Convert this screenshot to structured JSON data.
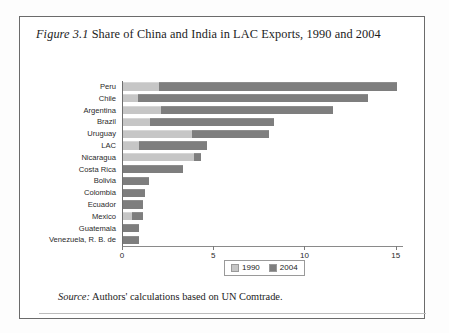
{
  "figure": {
    "number_label": "Figure 3.1",
    "title_text": " Share of China and India in LAC Exports, 1990 and 2004",
    "source_label": "Source:",
    "source_text": " Authors' calculations based on UN Comtrade."
  },
  "colors": {
    "series_1990": "#c6c6c6",
    "series_2004": "#7e7e7e",
    "frame": "#6b6b6b",
    "axis": "#7a7a7a"
  },
  "chart_data": {
    "type": "bar",
    "orientation": "horizontal",
    "stacked": true,
    "title": "Figure 3.1 Share of China and India in LAC Exports, 1990 and 2004",
    "xlabel": "percent",
    "ylabel": "",
    "xlim": [
      0,
      15.4
    ],
    "xticks": [
      0,
      5,
      10,
      15
    ],
    "xtick_labels": [
      "0",
      "5",
      "10",
      "15"
    ],
    "grid": false,
    "legend_position": "bottom-center",
    "categories": [
      "Peru",
      "Chile",
      "Argentina",
      "Brazil",
      "Uruguay",
      "LAC",
      "Nicaragua",
      "Costa Rica",
      "Bolivia",
      "Colombia",
      "Ecuador",
      "Mexico",
      "Guatemala",
      "Venezuela, R. B. de"
    ],
    "series": [
      {
        "name": "1990",
        "color": "#c6c6c6",
        "values": [
          2.0,
          0.8,
          2.1,
          1.5,
          3.8,
          0.9,
          3.9,
          0.0,
          0.0,
          0.0,
          0.0,
          0.5,
          0.0,
          0.0
        ]
      },
      {
        "name": "2004",
        "color": "#7e7e7e",
        "values": [
          13.0,
          12.6,
          9.4,
          6.8,
          4.2,
          3.7,
          0.4,
          3.3,
          1.4,
          1.2,
          1.1,
          0.6,
          0.9,
          0.9
        ]
      }
    ],
    "totals": [
      15.0,
      13.4,
      11.5,
      8.3,
      8.0,
      4.6,
      4.3,
      3.3,
      1.4,
      1.2,
      1.1,
      1.1,
      0.9,
      0.9
    ]
  },
  "legend": {
    "entries": [
      {
        "label": "1990",
        "color": "#c6c6c6"
      },
      {
        "label": "2004",
        "color": "#7e7e7e"
      }
    ]
  }
}
